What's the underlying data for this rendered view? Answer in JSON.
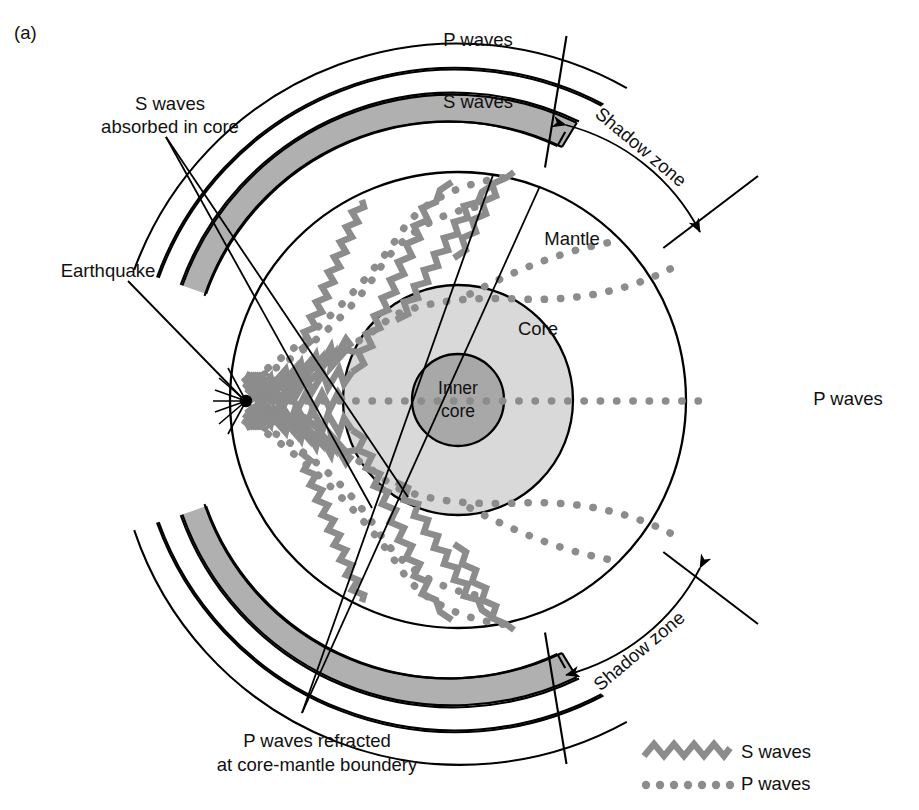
{
  "figure": {
    "panel_tag": "(a)",
    "type": "diagram"
  },
  "labels": {
    "p_waves_top": "P waves",
    "s_waves_top": "S waves",
    "p_waves_right": "P waves",
    "s_waves_absorbed": {
      "line1": "S waves",
      "line2": "absorbed in core"
    },
    "earthquake": "Earthquake",
    "mantle": "Mantle",
    "core": "Core",
    "inner_core": {
      "line1": "Inner",
      "line2": "core"
    },
    "shadow_zone_top": "Shadow zone",
    "shadow_zone_bottom": "Shadow zone",
    "p_refracted": {
      "line1": "P waves refracted",
      "line2": "at core-mantle boundery"
    }
  },
  "legend": {
    "items": [
      {
        "symbol": "zigzag-line",
        "label": "S waves",
        "color": "#8c8c8c"
      },
      {
        "symbol": "dotted-line",
        "label": "P waves",
        "color": "#8c8c8c"
      }
    ]
  },
  "colors": {
    "stroke": "#000000",
    "mantle_fill": "#ffffff",
    "core_fill": "#d9d9d9",
    "inner_core_fill": "#a8a8a8",
    "s_band_fill": "#b0b0b0",
    "p_band_fill": "#ffffff",
    "wave_gray": "#8c8c8c",
    "background": "#ffffff"
  },
  "geometry": {
    "center_x": 458,
    "center_y": 400,
    "earth_radius": 228,
    "core_radius": 115,
    "inner_core_radius": 46,
    "earthquake_point": {
      "x": 246,
      "y": 401
    },
    "bands": [
      {
        "name": "s-wave-arrival-band",
        "inner_radius": 228,
        "outer_radius": 257,
        "fill": "#ffffff"
      },
      {
        "name": "s-wave-shaded-band",
        "inner_radius": 259,
        "outer_radius": 287,
        "fill": "#b0b0b0"
      },
      {
        "name": "p-wave-inner-band",
        "inner_radius": 289,
        "outer_radius": 315,
        "fill": "#ffffff"
      },
      {
        "name": "p-wave-outer-band",
        "inner_radius": 317,
        "outer_radius": 344,
        "fill": "#ffffff"
      }
    ]
  }
}
